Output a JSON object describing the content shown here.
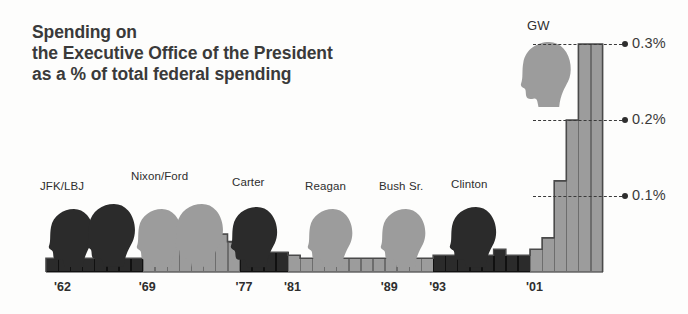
{
  "title": {
    "line1": "Spending on",
    "line2": "the Executive Office of the President",
    "line3": "as a % of total federal spending"
  },
  "colors": {
    "democrat": "#2b2b2b",
    "republican": "#9c9c9c",
    "outline": "#4a4a4a",
    "text": "#3a3a3a",
    "background": "#fdfdfc"
  },
  "chart_data": {
    "type": "bar",
    "title": "Spending on the Executive Office of the President as a % of total federal spending",
    "xlabel": "",
    "ylabel": "% of total federal spending",
    "ylim": [
      0,
      0.32
    ],
    "grid": false,
    "legend_position": "none",
    "y_gridlines": [
      {
        "label": "0.1%",
        "value": 0.1
      },
      {
        "label": "0.2%",
        "value": 0.2
      },
      {
        "label": "0.3%",
        "value": 0.3
      }
    ],
    "x_tick_labels": [
      "'62",
      "'69",
      "'77",
      "'81",
      "'89",
      "'93",
      "'01"
    ],
    "x_tick_years": [
      1962,
      1969,
      1977,
      1981,
      1989,
      1993,
      2001
    ],
    "administrations": [
      {
        "name": "JFK/LBJ",
        "party": "democrat",
        "start_year": 1961,
        "end_year": 1968
      },
      {
        "name": "Nixon/Ford",
        "party": "republican",
        "start_year": 1969,
        "end_year": 1976
      },
      {
        "name": "Carter",
        "party": "democrat",
        "start_year": 1977,
        "end_year": 1980
      },
      {
        "name": "Reagan",
        "party": "republican",
        "start_year": 1981,
        "end_year": 1988
      },
      {
        "name": "Bush Sr.",
        "party": "republican",
        "start_year": 1989,
        "end_year": 1992
      },
      {
        "name": "Clinton",
        "party": "democrat",
        "start_year": 1993,
        "end_year": 2000
      },
      {
        "name": "GW",
        "party": "republican",
        "start_year": 2001,
        "end_year": 2006
      }
    ],
    "categories": [
      1961,
      1962,
      1963,
      1964,
      1965,
      1966,
      1967,
      1968,
      1969,
      1970,
      1971,
      1972,
      1973,
      1974,
      1975,
      1976,
      1977,
      1978,
      1979,
      1980,
      1981,
      1982,
      1983,
      1984,
      1985,
      1986,
      1987,
      1988,
      1989,
      1990,
      1991,
      1992,
      1993,
      1994,
      1995,
      1996,
      1997,
      1998,
      1999,
      2000,
      2001,
      2002,
      2003,
      2004,
      2005,
      2006
    ],
    "values": [
      0.018,
      0.018,
      0.02,
      0.018,
      0.026,
      0.018,
      0.018,
      0.018,
      0.03,
      0.03,
      0.038,
      0.046,
      0.052,
      0.058,
      0.05,
      0.04,
      0.026,
      0.026,
      0.026,
      0.026,
      0.022,
      0.018,
      0.018,
      0.018,
      0.018,
      0.018,
      0.018,
      0.018,
      0.018,
      0.018,
      0.018,
      0.018,
      0.022,
      0.022,
      0.022,
      0.022,
      0.022,
      0.03,
      0.022,
      0.022,
      0.03,
      0.045,
      0.12,
      0.2,
      0.3,
      0.3
    ],
    "annotations": [
      {
        "text": "GW",
        "note": "label above the final Republican administration silhouette"
      }
    ]
  }
}
